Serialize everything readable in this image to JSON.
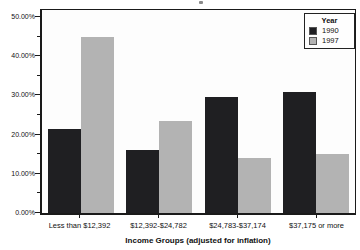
{
  "chart_data": {
    "type": "bar",
    "legend_title": "Year",
    "legend_position": "top-right",
    "grid": "off",
    "categories": [
      "Less than $12,392",
      "$12,392-$24,782",
      "$24,783-$37,174",
      "$37,175 or more"
    ],
    "series": [
      {
        "name": "1990",
        "color": "#1f1f22",
        "values": [
          21.5,
          16.2,
          29.6,
          30.8
        ]
      },
      {
        "name": "1997",
        "color": "#b3b3b3",
        "values": [
          45.0,
          23.6,
          14.0,
          15.0
        ]
      }
    ],
    "xlabel": "Income Groups (adjusted for inflation)",
    "ylabel": "",
    "ylim": [
      0,
      50
    ],
    "y_ticks": [
      {
        "value": 0,
        "label": "0.00%"
      },
      {
        "value": 10,
        "label": "10.00%"
      },
      {
        "value": 20,
        "label": "20.00%"
      },
      {
        "value": 30,
        "label": "30.00%"
      },
      {
        "value": 40,
        "label": "40.00%"
      },
      {
        "value": 50,
        "label": "50.00%"
      }
    ],
    "y_minor_ticks": [
      5,
      15,
      25,
      35,
      45
    ]
  }
}
